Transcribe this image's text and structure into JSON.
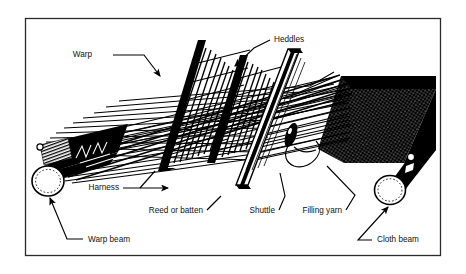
{
  "figure": {
    "type": "technical-line-diagram",
    "border_color": "#2a2a2a",
    "ink_color": "#000000",
    "paper_color": "#ffffff"
  },
  "labels": {
    "warp": "Warp",
    "heddles": "Heddles",
    "harness": "Harness",
    "reed_or_batten": "Reed or batten",
    "shuttle": "Shuttle",
    "filling_yarn": "Filling yarn",
    "warp_beam": "Warp beam",
    "cloth_beam": "Cloth beam"
  },
  "parts": [
    {
      "id": "warp",
      "name": "Warp",
      "description": "Set of parallel lengthwise yarns running from the warp beam"
    },
    {
      "id": "heddles",
      "name": "Heddles",
      "description": "Vertical wires in the harness frames that carry warp yarns"
    },
    {
      "id": "harness",
      "name": "Harness",
      "description": "Frames holding the heddles that raise and lower warp yarns"
    },
    {
      "id": "reed-or-batten",
      "name": "Reed or batten",
      "description": "Comb-like bar that beats the filling yarn into the cloth"
    },
    {
      "id": "shuttle",
      "name": "Shuttle",
      "description": "Boat-shaped carrier that passes the filling yarn across the shed"
    },
    {
      "id": "filling-yarn",
      "name": "Filling yarn",
      "description": "Crosswise yarn laid in by the shuttle"
    },
    {
      "id": "warp-beam",
      "name": "Warp beam",
      "description": "Roller at the back holding the supply of warp yarn"
    },
    {
      "id": "cloth-beam",
      "name": "Cloth beam",
      "description": "Roller at the front onto which the woven cloth is wound"
    }
  ]
}
